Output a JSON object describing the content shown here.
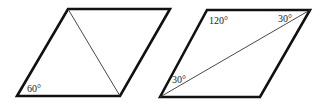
{
  "figures": [
    {
      "name": "left-rhombus",
      "vertices": [
        [
          17,
          96
        ],
        [
          68,
          9
        ],
        [
          170,
          9
        ],
        [
          120,
          96
        ]
      ],
      "diagonal": [
        [
          68,
          9
        ],
        [
          120,
          96
        ]
      ],
      "labels": [
        {
          "text": "60°",
          "x": 27,
          "y": 92
        }
      ]
    },
    {
      "name": "right-rhombus",
      "vertices": [
        [
          160,
          97
        ],
        [
          207,
          10
        ],
        [
          310,
          10
        ],
        [
          260,
          97
        ]
      ],
      "diagonal": [
        [
          160,
          97
        ],
        [
          310,
          10
        ]
      ],
      "labels": [
        {
          "text": "120°",
          "x": 209,
          "y": 24
        },
        {
          "text": "30°",
          "x": 278,
          "y": 22
        },
        {
          "text": "30°",
          "x": 172,
          "y": 83
        }
      ]
    }
  ],
  "colors": {
    "stroke": "#111111",
    "background": "#ffffff"
  }
}
